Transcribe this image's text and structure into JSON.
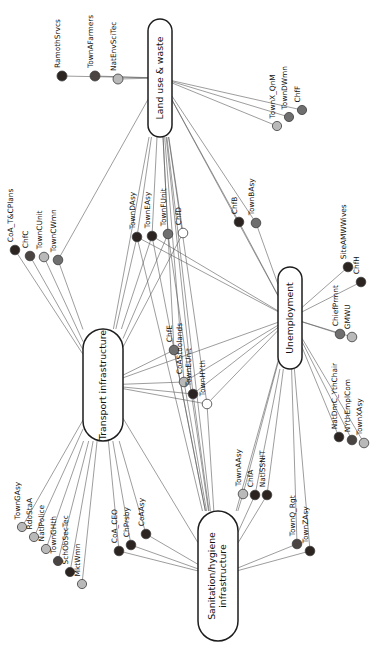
{
  "figure": {
    "type": "network-diagram",
    "orientation": "rotated-90-ccw",
    "background": "#ffffff",
    "edge_color": "#5b5b5b",
    "hub_fill": "#ffffff",
    "hub_stroke": "#1d1d1d"
  },
  "legend_colors": {
    "dark": "#2b2420",
    "mid_dark": "#4a4542",
    "mid": "#6f6f6f",
    "light": "#b9b9b9",
    "open": "#ffffff"
  },
  "hubs": [
    {
      "id": "land",
      "label": "Land use & waste",
      "x": 160,
      "y": 78,
      "w": 24,
      "h": 118
    },
    {
      "id": "transport",
      "label": "Transport infrastructure",
      "x": 103,
      "y": 385,
      "w": 40,
      "h": 112
    },
    {
      "id": "unemp",
      "label": "Unemployment",
      "x": 290,
      "y": 318,
      "w": 24,
      "h": 102
    },
    {
      "id": "sanit",
      "label": "Sanitation/hygiene infrastructure",
      "x": 218,
      "y": 576,
      "w": 40,
      "h": 130
    }
  ],
  "nodes": [
    {
      "id": "RamothSrvcs",
      "label": "RamothSrvcs",
      "x": 62,
      "y": 76,
      "tone": "dark",
      "r": 5.0
    },
    {
      "id": "TownAFarmers",
      "label": "TownAFarmers",
      "x": 95,
      "y": 76,
      "tone": "mid_dark",
      "r": 5.0
    },
    {
      "id": "NatEnvSciTec",
      "label": "NatEnvSciTec",
      "x": 118,
      "y": 79,
      "tone": "light",
      "r": 5.0
    },
    {
      "id": "TownX_QnM",
      "label": "TownX_QnM",
      "x": 277,
      "y": 126,
      "tone": "light",
      "r": 4.6
    },
    {
      "id": "TownDWmn",
      "label": "TownDWmn",
      "x": 289,
      "y": 117,
      "tone": "mid",
      "r": 4.6
    },
    {
      "id": "ChfF",
      "label": "ChfF",
      "x": 302,
      "y": 110,
      "tone": "mid",
      "r": 4.6
    },
    {
      "id": "CoA_T&CPlans",
      "label": "CoA_T&CPlans",
      "x": 15,
      "y": 250,
      "tone": "dark",
      "r": 4.8
    },
    {
      "id": "ChfC",
      "label": "ChfC",
      "x": 30,
      "y": 256,
      "tone": "mid_dark",
      "r": 4.8
    },
    {
      "id": "TownCUnit",
      "label": "TownCUnit",
      "x": 44,
      "y": 257,
      "tone": "light",
      "r": 4.8
    },
    {
      "id": "TownCWmn",
      "label": "TownCWmn",
      "x": 58,
      "y": 260,
      "tone": "mid",
      "r": 4.8
    },
    {
      "id": "TownDAsy",
      "label": "TownDAsy",
      "x": 137,
      "y": 237,
      "tone": "dark",
      "r": 4.8
    },
    {
      "id": "TownEAsy",
      "label": "TownEAsy",
      "x": 152,
      "y": 236,
      "tone": "dark",
      "r": 4.8
    },
    {
      "id": "TownFUnit",
      "label": "TownFUnit",
      "x": 168,
      "y": 234,
      "tone": "mid",
      "r": 4.8
    },
    {
      "id": "ChfD",
      "label": "ChfD",
      "x": 183,
      "y": 233,
      "tone": "open",
      "r": 4.8
    },
    {
      "id": "ChfB",
      "label": "ChfB",
      "x": 239,
      "y": 222,
      "tone": "dark",
      "r": 4.8
    },
    {
      "id": "TownBAsy",
      "label": "TownBAsy",
      "x": 256,
      "y": 223,
      "tone": "mid",
      "r": 4.8
    },
    {
      "id": "SiteAMWWives",
      "label": "SiteAMWWives",
      "x": 348,
      "y": 267,
      "tone": "dark",
      "r": 4.8
    },
    {
      "id": "ChfH",
      "label": "ChfH",
      "x": 361,
      "y": 282,
      "tone": "dark",
      "r": 4.8
    },
    {
      "id": "ChiefPrmnt",
      "label": "ChiefPrmnt",
      "x": 340,
      "y": 334,
      "tone": "mid",
      "r": 4.8
    },
    {
      "id": "GMWU",
      "label": "GMWU",
      "x": 352,
      "y": 337,
      "tone": "light",
      "r": 4.8
    },
    {
      "id": "ChfE",
      "label": "ChfE",
      "x": 174,
      "y": 350,
      "tone": "mid",
      "r": 4.8
    },
    {
      "id": "CoAStoolands",
      "label": "CoAStoolands",
      "x": 184,
      "y": 382,
      "tone": "light",
      "r": 4.8
    },
    {
      "id": "TownEUnit",
      "label": "TownEUnit",
      "x": 193,
      "y": 394,
      "tone": "dark",
      "r": 4.8
    },
    {
      "id": "TownHYth",
      "label": "TownHYth",
      "x": 207,
      "y": 404,
      "tone": "open",
      "r": 4.8
    },
    {
      "id": "NatDmC_YthChair",
      "label": "NatDmC_YthChair",
      "x": 339,
      "y": 437,
      "tone": "dark",
      "r": 4.8
    },
    {
      "id": "NYthEmplCom",
      "label": "NYthEmplCom",
      "x": 352,
      "y": 440,
      "tone": "mid_dark",
      "r": 4.8
    },
    {
      "id": "TownXAsy",
      "label": "TownXAsy",
      "x": 364,
      "y": 443,
      "tone": "light",
      "r": 4.8
    },
    {
      "id": "TownAAsy",
      "label": "TownAAsy",
      "x": 243,
      "y": 494,
      "tone": "light",
      "r": 4.8
    },
    {
      "id": "ChfA",
      "label": "ChfA",
      "x": 255,
      "y": 495,
      "tone": "dark",
      "r": 4.8
    },
    {
      "id": "NatlSSNIT",
      "label": "NatlSSNIT",
      "x": 267,
      "y": 495,
      "tone": "dark",
      "r": 4.8
    },
    {
      "id": "TownGAsy",
      "label": "TownGAsy",
      "x": 22,
      "y": 527,
      "tone": "light",
      "r": 4.6
    },
    {
      "id": "RdoStaA",
      "label": "RdoStaA",
      "x": 34,
      "y": 537,
      "tone": "light",
      "r": 4.6
    },
    {
      "id": "NatlPolice",
      "label": "NatlPolice",
      "x": 46,
      "y": 549,
      "tone": "light",
      "r": 4.6
    },
    {
      "id": "TownGHth",
      "label": "TownGHth",
      "x": 58,
      "y": 561,
      "tone": "mid_dark",
      "r": 4.6
    },
    {
      "id": "SchObSecTec",
      "label": "SchObSecTec",
      "x": 70,
      "y": 572,
      "tone": "dark",
      "r": 4.6
    },
    {
      "id": "MktWmn",
      "label": "MktWmn",
      "x": 82,
      "y": 584,
      "tone": "light",
      "r": 4.6
    },
    {
      "id": "CoA_CEO",
      "label": "CoA_CEO",
      "x": 119,
      "y": 551,
      "tone": "dark",
      "r": 4.8
    },
    {
      "id": "ChPrsby",
      "label": "ChPrsby",
      "x": 131,
      "y": 545,
      "tone": "dark",
      "r": 4.8
    },
    {
      "id": "CoAAsy",
      "label": "CoAAsy",
      "x": 146,
      "y": 534,
      "tone": "dark",
      "r": 4.8
    },
    {
      "id": "TownQ_Rgt",
      "label": "TownQ_Rgt",
      "x": 297,
      "y": 544,
      "tone": "mid_dark",
      "r": 4.8
    },
    {
      "id": "TownZAsy",
      "label": "TownZAsy",
      "x": 310,
      "y": 551,
      "tone": "dark",
      "r": 4.8
    }
  ],
  "label_offsets": {
    "default": {
      "dx": 6,
      "dy": -2,
      "rotate": -90
    }
  },
  "edges": [
    [
      "RamothSrvcs",
      "land"
    ],
    [
      "TownAFarmers",
      "land"
    ],
    [
      "NatEnvSciTec",
      "land"
    ],
    [
      "land",
      "TownX_QnM"
    ],
    [
      "land",
      "TownDWmn"
    ],
    [
      "land",
      "ChfF"
    ],
    [
      "land",
      "TownCWmn"
    ],
    [
      "land",
      "TownDAsy"
    ],
    [
      "land",
      "TownEAsy"
    ],
    [
      "land",
      "TownFUnit"
    ],
    [
      "land",
      "ChfD"
    ],
    [
      "land",
      "ChfE"
    ],
    [
      "land",
      "CoAStoolands"
    ],
    [
      "land",
      "TownEUnit"
    ],
    [
      "land",
      "TownHYth"
    ],
    [
      "land",
      "ChfB"
    ],
    [
      "land",
      "TownBAsy"
    ],
    [
      "land",
      "unemp"
    ],
    [
      "land",
      "transport"
    ],
    [
      "land",
      "sanit"
    ],
    [
      "CoA_T&CPlans",
      "transport"
    ],
    [
      "ChfC",
      "transport"
    ],
    [
      "TownCUnit",
      "transport"
    ],
    [
      "TownCWmn",
      "transport"
    ],
    [
      "transport",
      "TownDAsy"
    ],
    [
      "transport",
      "TownEAsy"
    ],
    [
      "transport",
      "TownFUnit"
    ],
    [
      "transport",
      "ChfD"
    ],
    [
      "transport",
      "ChfE"
    ],
    [
      "transport",
      "CoAStoolands"
    ],
    [
      "transport",
      "TownEUnit"
    ],
    [
      "transport",
      "TownHYth"
    ],
    [
      "transport",
      "TownGAsy"
    ],
    [
      "transport",
      "RdoStaA"
    ],
    [
      "transport",
      "NatlPolice"
    ],
    [
      "transport",
      "TownGHth"
    ],
    [
      "transport",
      "SchObSecTec"
    ],
    [
      "transport",
      "MktWmn"
    ],
    [
      "transport",
      "CoA_CEO"
    ],
    [
      "transport",
      "ChPrsby"
    ],
    [
      "transport",
      "CoAAsy"
    ],
    [
      "transport",
      "sanit"
    ],
    [
      "transport",
      "unemp"
    ],
    [
      "ChfB",
      "unemp"
    ],
    [
      "TownBAsy",
      "unemp"
    ],
    [
      "unemp",
      "SiteAMWWives"
    ],
    [
      "unemp",
      "ChfH"
    ],
    [
      "unemp",
      "ChiefPrmnt"
    ],
    [
      "unemp",
      "GMWU"
    ],
    [
      "unemp",
      "NatDmC_YthChair"
    ],
    [
      "unemp",
      "NYthEmplCom"
    ],
    [
      "unemp",
      "TownXAsy"
    ],
    [
      "unemp",
      "TownAAsy"
    ],
    [
      "unemp",
      "ChfA"
    ],
    [
      "unemp",
      "NatlSSNIT"
    ],
    [
      "unemp",
      "TownQ_Rgt"
    ],
    [
      "unemp",
      "TownZAsy"
    ],
    [
      "unemp",
      "TownDAsy"
    ],
    [
      "unemp",
      "TownEAsy"
    ],
    [
      "unemp",
      "CoAStoolands"
    ],
    [
      "unemp",
      "TownEUnit"
    ],
    [
      "unemp",
      "TownHYth"
    ],
    [
      "unemp",
      "sanit"
    ],
    [
      "sanit",
      "TownAAsy"
    ],
    [
      "sanit",
      "ChfA"
    ],
    [
      "sanit",
      "NatlSSNIT"
    ],
    [
      "sanit",
      "TownQ_Rgt"
    ],
    [
      "sanit",
      "TownZAsy"
    ],
    [
      "sanit",
      "ChfE"
    ],
    [
      "sanit",
      "CoAStoolands"
    ],
    [
      "sanit",
      "TownEUnit"
    ],
    [
      "sanit",
      "TownHYth"
    ],
    [
      "sanit",
      "CoA_CEO"
    ],
    [
      "sanit",
      "ChPrsby"
    ],
    [
      "sanit",
      "CoAAsy"
    ],
    [
      "sanit",
      "TownDAsy"
    ],
    [
      "sanit",
      "TownEAsy"
    ],
    [
      "sanit",
      "TownFUnit"
    ]
  ]
}
